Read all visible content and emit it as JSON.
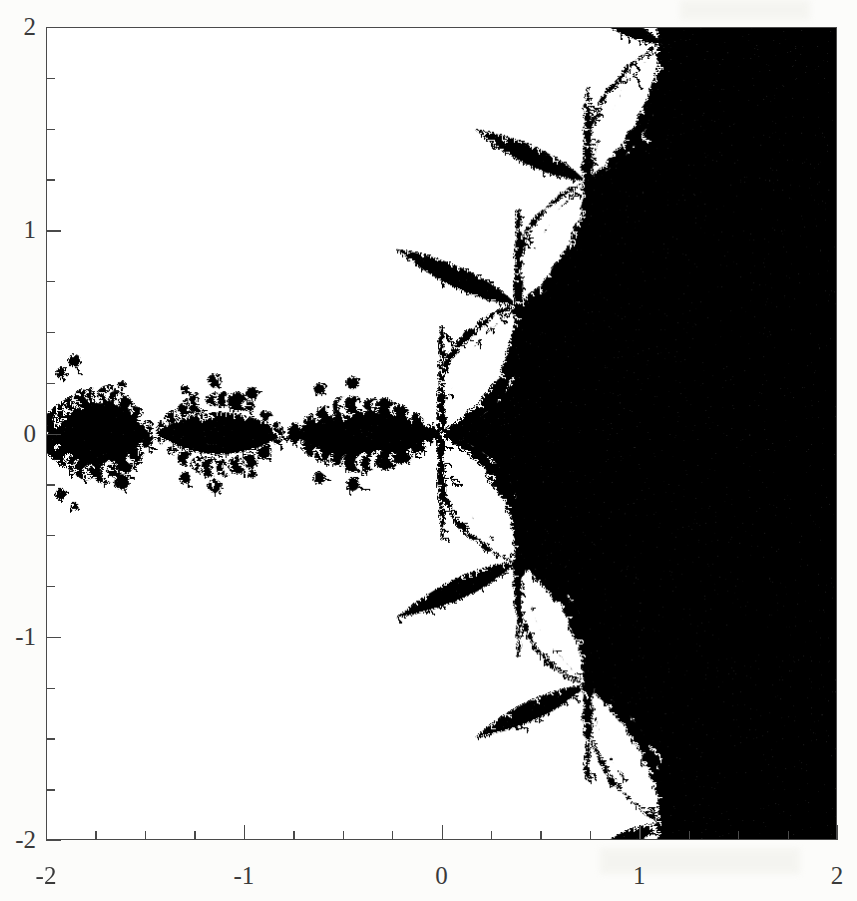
{
  "figure": {
    "type": "fractal-plot",
    "background_color": "#fcfcfa",
    "plot_background": "#ffffff",
    "set_color": "#000000",
    "frame_color": "#4a4a4a",
    "title": "",
    "caption": ""
  },
  "axes": {
    "x": {
      "label": "",
      "min": -2,
      "max": 2,
      "major_ticks": [
        -2,
        -1,
        0,
        1,
        2
      ],
      "major_tick_labels": [
        "-2",
        "-1",
        "0",
        "1",
        "2"
      ],
      "minor_tick_step": 0.25
    },
    "y": {
      "label": "",
      "min": -2,
      "max": 2,
      "major_ticks": [
        -2,
        -1,
        0,
        1,
        2
      ],
      "major_tick_labels": [
        "-2",
        "-1",
        "0",
        "1",
        "2"
      ],
      "minor_tick_step": 0.25
    }
  },
  "chart_data": {
    "type": "scatter",
    "title": "",
    "xlabel": "",
    "ylabel": "",
    "xlim": [
      -2,
      2
    ],
    "ylim": [
      -2,
      2
    ],
    "grid": false,
    "legend": null,
    "rendering": "binary-fill",
    "colors": {
      "in_set": "#000000",
      "out_set": "#ffffff"
    },
    "symmetry": "mirror about real axis (y = 0)",
    "solid_region": {
      "shape": "right half-plane",
      "x_from": 1.35,
      "x_to": 2.0,
      "y_from": -2.0,
      "y_to": 2.0
    },
    "real_axis_nodes_x": [
      -2.0,
      -1.46,
      -0.79,
      0.0
    ],
    "real_axis_cell_half_height": [
      0.3,
      0.26,
      0.22,
      0.2
    ],
    "branch_nodes": [
      {
        "x": 0.0,
        "y": 0.0
      },
      {
        "x": 0.39,
        "y": 0.63
      },
      {
        "x": 0.74,
        "y": 1.24
      },
      {
        "x": 1.12,
        "y": 1.92
      },
      {
        "x": 0.39,
        "y": -0.63
      },
      {
        "x": 0.74,
        "y": -1.24
      },
      {
        "x": 1.12,
        "y": -1.92
      }
    ],
    "boundary_texture": "beaded / bubbly self-similar decorations of decreasing size along every black-white edge"
  },
  "scan_artifacts": {
    "present": true,
    "note": "faint bleed-through smudges from the reverse page"
  }
}
